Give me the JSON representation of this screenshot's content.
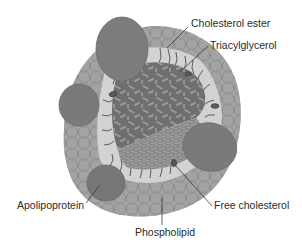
{
  "diagram": {
    "labels": {
      "cholesterol_ester": "Cholesterol ester",
      "triacylglycerol": "Triacylglycerol",
      "apolipoprotein": "Apolipoprotein",
      "free_cholesterol": "Free cholesterol",
      "phospholipid": "Phospholipid"
    },
    "colors": {
      "background": "#ffffff",
      "phospholipid_head": "#a3a3a3",
      "phospholipid_edge": "#7d7d7d",
      "apolipoprotein": "#7a7a7a",
      "core_dark": "#6e6e6e",
      "core_light": "#8c8c8c",
      "tail_zone": "#d6d6d6",
      "leader_line": "#3a3a3a",
      "text": "#2a2a2a"
    }
  }
}
